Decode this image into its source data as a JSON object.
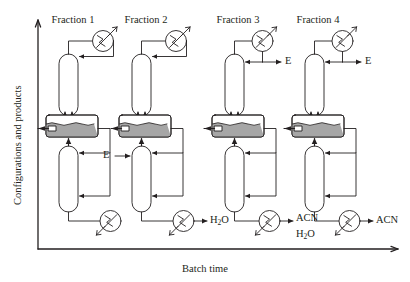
{
  "figure": {
    "type": "process-flow-diagram",
    "axes": {
      "y_label": "Configurations and products",
      "x_label": "Batch time",
      "origin_px": [
        38,
        249
      ],
      "x_axis_end_px": [
        400,
        249
      ],
      "y_axis_top_px": [
        38,
        20
      ]
    },
    "colors": {
      "line": "#231f20",
      "text": "#231f20",
      "vessel_fill": "#ffffff",
      "liquid_fill": "#a6a6a6",
      "background": "#ffffff"
    },
    "columns_x_px": [
      72,
      145,
      238,
      318
    ],
    "fractions": [
      {
        "id": "fraction-1",
        "title": "Fraction 1",
        "title_x_px": 72,
        "origin_x_px": 72,
        "has_top_product": false,
        "top_product_label": "",
        "has_feed": false,
        "feed_label": "",
        "has_bottom_product": false,
        "bottom_product_labels": []
      },
      {
        "id": "fraction-2",
        "title": "Fraction 2",
        "title_x_px": 145,
        "origin_x_px": 145,
        "has_top_product": false,
        "top_product_label": "",
        "has_feed": true,
        "feed_label": "E",
        "has_bottom_product": true,
        "bottom_product_labels": [
          "H2O"
        ]
      },
      {
        "id": "fraction-3",
        "title": "Fraction 3",
        "title_x_px": 238,
        "origin_x_px": 238,
        "has_top_product": true,
        "top_product_label": "E",
        "has_feed": false,
        "feed_label": "",
        "has_bottom_product": true,
        "bottom_product_labels": [
          "ACN",
          "H2O"
        ]
      },
      {
        "id": "fraction-4",
        "title": "Fraction 4",
        "title_x_px": 318,
        "origin_x_px": 318,
        "has_top_product": true,
        "top_product_label": "E",
        "has_feed": false,
        "feed_label": "",
        "has_bottom_product": true,
        "bottom_product_labels": [
          "ACN"
        ]
      }
    ],
    "equipment": {
      "condenser_name": "condenser",
      "reboiler_name": "reboiler",
      "upper_column_name": "rectifying-column",
      "lower_column_name": "stripping-column",
      "middle_vessel_name": "middle-vessel"
    },
    "labels": {
      "E": "E",
      "ACN": "ACN",
      "H2O_main": "H",
      "H2O_sub": "2",
      "H2O_tail": "O"
    }
  }
}
